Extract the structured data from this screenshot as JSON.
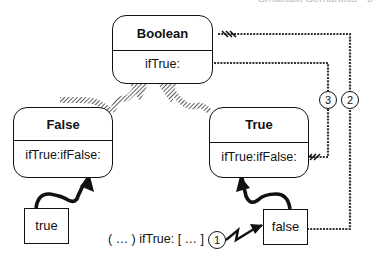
{
  "header": {
    "cut_off_text": "Smalltalk Semantics  •  3"
  },
  "classes": {
    "boolean": {
      "name": "Boolean",
      "method": "ifTrue:"
    },
    "false_class": {
      "name": "False",
      "method": "ifTrue:ifFalse:"
    },
    "true_class": {
      "name": "True",
      "method": "ifTrue:ifFalse:"
    }
  },
  "instances": {
    "true_obj": {
      "label": "true"
    },
    "false_obj": {
      "label": "false"
    }
  },
  "message": {
    "expression": "( … ) ifTrue: [ … ]"
  },
  "steps": {
    "step1": "1",
    "step2": "2",
    "step3": "3"
  },
  "colors": {
    "line": "#111111",
    "hatch": "#555555",
    "background": "#ffffff"
  }
}
